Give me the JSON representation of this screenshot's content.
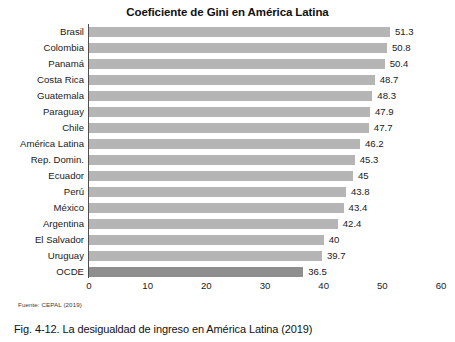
{
  "chart_data": {
    "type": "bar",
    "orientation": "horizontal",
    "title": "Coeficiente de Gini en América Latina",
    "xlabel": "",
    "ylabel": "",
    "xlim": [
      0,
      60
    ],
    "xticks": [
      "0",
      "10",
      "20",
      "30",
      "40",
      "50",
      "60"
    ],
    "grid": false,
    "legend": null,
    "categories": [
      "Brasil",
      "Colombia",
      "Panamá",
      "Costa Rica",
      "Guatemala",
      "Paraguay",
      "Chile",
      "América Latina",
      "Rep. Domin.",
      "Ecuador",
      "Perú",
      "México",
      "Argentina",
      "El Salvador",
      "Uruguay",
      "OCDE"
    ],
    "values": [
      51.3,
      50.8,
      50.4,
      48.7,
      48.3,
      47.9,
      47.7,
      46.2,
      45.3,
      45,
      43.8,
      43.4,
      42.4,
      40,
      39.7,
      36.5
    ],
    "value_labels": [
      "51.3",
      "50.8",
      "50.4",
      "48.7",
      "48.3",
      "47.9",
      "47.7",
      "46.2",
      "45.3",
      "45",
      "43.8",
      "43.4",
      "42.4",
      "40",
      "39.7",
      "36.5"
    ],
    "highlight_index": 15,
    "colors": {
      "bar": "#b5b5b5",
      "bar_highlight": "#8e8e8e",
      "axis": "#4d4d4d",
      "text": "#1a1a1a"
    }
  },
  "source": "Fuente: CEPAL (2019)",
  "caption": "Fig. 4-12. La desigualdad de ingreso en América Latina (2019)"
}
